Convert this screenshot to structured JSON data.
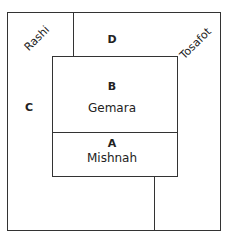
{
  "diagram": {
    "regions": {
      "A": {
        "letter": "A",
        "name": "Mishnah"
      },
      "B": {
        "letter": "B",
        "name": "Gemara"
      },
      "C": {
        "letter": "C"
      },
      "D": {
        "letter": "D"
      }
    },
    "side_labels": {
      "left": "Rashi",
      "right": "Tosafot"
    }
  }
}
